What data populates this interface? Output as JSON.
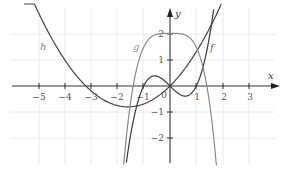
{
  "chart_data": {
    "type": "line",
    "title": "",
    "xlabel": "x",
    "ylabel": "y",
    "xlim": [
      -6,
      4
    ],
    "ylim": [
      -3,
      3
    ],
    "grid": true,
    "x_ticks": [
      -5,
      -4,
      -3,
      -2,
      -1,
      0,
      1,
      2,
      3
    ],
    "y_ticks": [
      -2,
      -1,
      1,
      2
    ],
    "x_tick_labels": [
      "−5",
      "−4",
      "−3",
      "−2",
      "−1",
      "0",
      "1",
      "2",
      "3"
    ],
    "y_tick_labels": [
      "−2",
      "−1",
      "1",
      "2"
    ],
    "series": [
      {
        "name": "h",
        "description": "parabola with roots at about x=-3.2 and x=0, minimum near (-1.6, -0.8)",
        "color": "#444444",
        "x": [
          -5.5,
          -5,
          -4,
          -3.2,
          -3,
          -2,
          -1.6,
          -1,
          0,
          1,
          1.5,
          1.9
        ],
        "values": [
          3.9,
          2.8,
          1.0,
          0.0,
          -0.19,
          -0.74,
          -0.79,
          -0.68,
          0.0,
          1.3,
          2.2,
          3.0
        ]
      },
      {
        "name": "f",
        "description": "cubic f(x) ≈ x³ − x, roots at −1, 0, 1",
        "color": "#444444",
        "x": [
          -1.65,
          -1.5,
          -1,
          -0.58,
          0,
          0.58,
          1,
          1.5,
          1.65
        ],
        "values": [
          -2.8,
          -1.88,
          0.0,
          0.38,
          0.0,
          -0.38,
          0.0,
          1.88,
          2.8
        ]
      },
      {
        "name": "g",
        "description": "quartic-like g(x) ≈ 2 − 0.5x⁴, plateau at y=2, roots near ±1.4",
        "color": "#8a8a8a",
        "x": [
          -1.75,
          -1.4,
          -1,
          -0.5,
          0,
          0.5,
          1,
          1.4,
          1.75
        ],
        "values": [
          -2.7,
          0.08,
          1.5,
          1.97,
          2.0,
          1.97,
          1.5,
          0.08,
          -2.7
        ]
      }
    ],
    "annotations": [
      {
        "text": "h",
        "x": -4.8,
        "y": 1.5
      },
      {
        "text": "g",
        "x": -1.3,
        "y": 1.5
      },
      {
        "text": "f",
        "x": 1.6,
        "y": 1.45
      }
    ]
  },
  "labels": {
    "x_axis": "x",
    "y_axis": "y",
    "curve_h": "h",
    "curve_g": "g",
    "curve_f": "f",
    "origin": "0",
    "tick_m5": "−5",
    "tick_m4": "−4",
    "tick_m3": "−3",
    "tick_m2": "−2",
    "tick_m1": "−1",
    "tick_1": "1",
    "tick_2": "2",
    "tick_3": "3",
    "ytick_2": "2",
    "ytick_1": "1",
    "ytick_m1": "−1",
    "ytick_m2": "−2"
  }
}
